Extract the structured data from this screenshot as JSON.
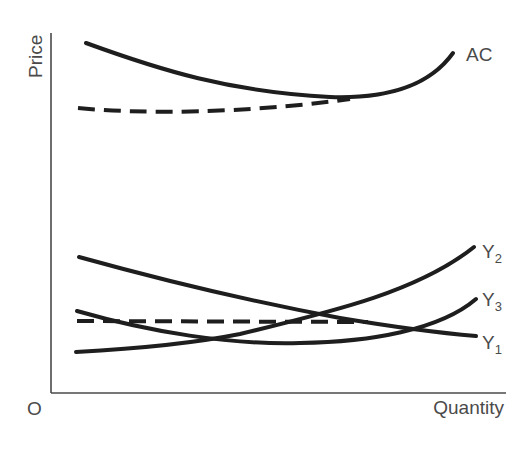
{
  "diagram": {
    "axes": {
      "y_label": "Price",
      "x_label": "Quantity",
      "origin_label": "O"
    },
    "curves": [
      {
        "id": "AC",
        "label": "AC",
        "style": "solid",
        "description": "U-shaped average cost curve, high"
      },
      {
        "id": "AC_dashed",
        "label": "",
        "style": "dashed",
        "description": "lower dashed curve joining AC near its minimum"
      },
      {
        "id": "Y1",
        "label": "Y",
        "subscript": "1",
        "style": "solid",
        "description": "downward-sloping"
      },
      {
        "id": "Y2",
        "label": "Y",
        "subscript": "2",
        "style": "solid",
        "description": "upward-sloping, convex"
      },
      {
        "id": "Y3",
        "label": "Y",
        "subscript": "3",
        "style": "solid",
        "description": "U-shaped, lower"
      },
      {
        "id": "horizontal_dashed",
        "label": "",
        "style": "dashed",
        "description": "horizontal dashed line at low price level"
      }
    ],
    "colors": {
      "curve": "#1e1e1e",
      "axis": "#4a4a4a",
      "text": "#4a4a4a",
      "background": "#ffffff"
    }
  }
}
